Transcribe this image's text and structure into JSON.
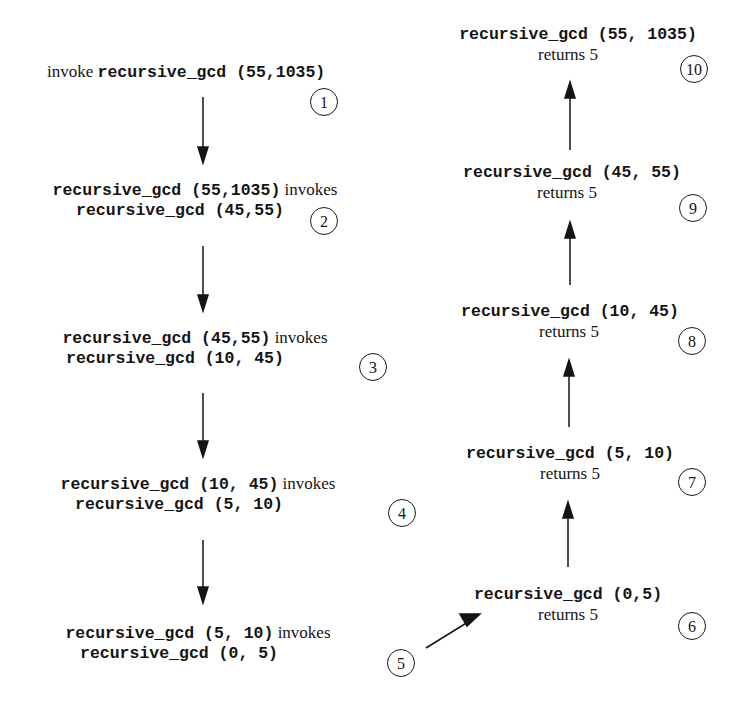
{
  "diagram": {
    "invocations": [
      {
        "step": "1",
        "prefix": "invoke",
        "call": "recursive_gcd (55,1035)",
        "line2": ""
      },
      {
        "step": "2",
        "prefix": "",
        "call": "recursive_gcd (55,1035)",
        "verb": "invokes",
        "line2": "recursive_gcd (45,55)"
      },
      {
        "step": "3",
        "prefix": "",
        "call": "recursive_gcd (45,55)",
        "verb": "invokes",
        "line2": "recursive_gcd (10, 45)"
      },
      {
        "step": "4",
        "prefix": "",
        "call": "recursive_gcd (10, 45)",
        "verb": "invokes",
        "line2": "recursive_gcd (5, 10)"
      },
      {
        "step": "5",
        "prefix": "",
        "call": "recursive_gcd (5, 10)",
        "verb": "invokes",
        "line2": "recursive_gcd (0, 5)"
      }
    ],
    "returns": [
      {
        "step": "6",
        "call": "recursive_gcd (0,5)",
        "result": "returns 5"
      },
      {
        "step": "7",
        "call": "recursive_gcd (5, 10)",
        "result": "returns 5"
      },
      {
        "step": "8",
        "call": "recursive_gcd (10, 45)",
        "result": "returns 5"
      },
      {
        "step": "9",
        "call": "recursive_gcd (45, 55)",
        "result": "returns 5"
      },
      {
        "step": "10",
        "call": "recursive_gcd (55, 1035)",
        "result": "returns 5"
      }
    ],
    "colors": {
      "ink": "#141414",
      "background": "#ffffff"
    }
  }
}
